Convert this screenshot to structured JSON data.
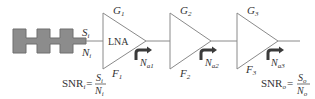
{
  "diagram": {
    "title": "",
    "colors": {
      "line": "#8a8a8a",
      "filter_fill": "#8c8c8c",
      "filter_stroke": "#6e6e6e",
      "arrow": "#3a3a3a",
      "text": "#333333"
    },
    "filter": {
      "label": "",
      "input_signal": {
        "symbol": "S",
        "sub": "i"
      },
      "input_noise": {
        "symbol": "N",
        "sub": "i"
      }
    },
    "stages": [
      {
        "id": "lna",
        "inner_label": "LNA",
        "gain": {
          "symbol": "G",
          "sub": "1"
        },
        "noise_figure": {
          "symbol": "F",
          "sub": "1"
        },
        "noise_source": {
          "symbol": "N",
          "sub": "a1"
        }
      },
      {
        "id": "stage2",
        "inner_label": "",
        "gain": {
          "symbol": "G",
          "sub": "2"
        },
        "noise_figure": {
          "symbol": "F",
          "sub": "2"
        },
        "noise_source": {
          "symbol": "N",
          "sub": "a2"
        }
      },
      {
        "id": "stage3",
        "inner_label": "",
        "gain": {
          "symbol": "G",
          "sub": "3"
        },
        "noise_figure": {
          "symbol": "F",
          "sub": "3"
        },
        "noise_source": {
          "symbol": "N",
          "sub": "a3"
        }
      }
    ],
    "snr_input": {
      "lhs": "SNR",
      "lhs_sub": "i",
      "eq": "=",
      "num": "S",
      "num_sub": "i",
      "den": "N",
      "den_sub": "i"
    },
    "snr_output": {
      "lhs": "SNR",
      "lhs_sub": "o",
      "eq": "=",
      "num": "S",
      "num_sub": "o",
      "den": "N",
      "den_sub": "o"
    }
  }
}
